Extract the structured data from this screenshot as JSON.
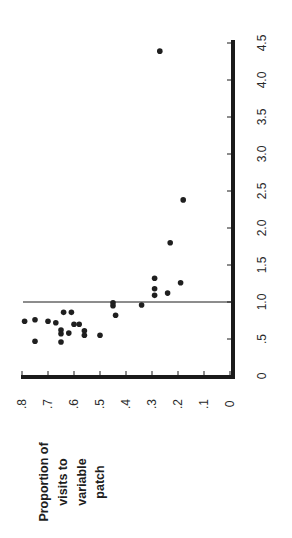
{
  "chart_data": {
    "type": "scatter",
    "orientation": "rotated 90 degrees counter-clockwise",
    "title": "",
    "ylabel": "Proportion of visits to variable patch",
    "ylabel_lines": [
      "Proportion of",
      "visits to",
      "variable",
      "patch"
    ],
    "xlabel": "",
    "proportion_axis": {
      "ticks": [
        ".8",
        ".7",
        ".6",
        ".5",
        ".4",
        ".3",
        ".2",
        ".1",
        "0"
      ],
      "tick_values": [
        0.8,
        0.7,
        0.6,
        0.5,
        0.4,
        0.3,
        0.2,
        0.1,
        0.0
      ],
      "range": [
        0,
        0.8
      ]
    },
    "ratio_axis": {
      "ticks": [
        "0",
        ".5",
        "1.0",
        "1.5",
        "2.0",
        "2.5",
        "3.0",
        "3.5",
        "4.0",
        "4.5"
      ],
      "tick_values": [
        0,
        0.5,
        1.0,
        1.5,
        2.0,
        2.5,
        3.0,
        3.5,
        4.0,
        4.5
      ],
      "range": [
        0,
        4.5
      ]
    },
    "reference_line": {
      "ratio": 1.0
    },
    "grid": false,
    "legend": null,
    "points": [
      {
        "proportion": 0.79,
        "ratio": 0.74
      },
      {
        "proportion": 0.75,
        "ratio": 0.76
      },
      {
        "proportion": 0.75,
        "ratio": 0.47
      },
      {
        "proportion": 0.7,
        "ratio": 0.74
      },
      {
        "proportion": 0.67,
        "ratio": 0.72
      },
      {
        "proportion": 0.64,
        "ratio": 0.86
      },
      {
        "proportion": 0.61,
        "ratio": 0.86
      },
      {
        "proportion": 0.65,
        "ratio": 0.62
      },
      {
        "proportion": 0.65,
        "ratio": 0.57
      },
      {
        "proportion": 0.65,
        "ratio": 0.46
      },
      {
        "proportion": 0.62,
        "ratio": 0.58
      },
      {
        "proportion": 0.6,
        "ratio": 0.7
      },
      {
        "proportion": 0.58,
        "ratio": 0.7
      },
      {
        "proportion": 0.56,
        "ratio": 0.61
      },
      {
        "proportion": 0.56,
        "ratio": 0.55
      },
      {
        "proportion": 0.5,
        "ratio": 0.55
      },
      {
        "proportion": 0.45,
        "ratio": 0.99
      },
      {
        "proportion": 0.45,
        "ratio": 0.95
      },
      {
        "proportion": 0.44,
        "ratio": 0.82
      },
      {
        "proportion": 0.34,
        "ratio": 0.96
      },
      {
        "proportion": 0.29,
        "ratio": 1.32
      },
      {
        "proportion": 0.29,
        "ratio": 1.18
      },
      {
        "proportion": 0.29,
        "ratio": 1.09
      },
      {
        "proportion": 0.24,
        "ratio": 1.12
      },
      {
        "proportion": 0.23,
        "ratio": 1.8
      },
      {
        "proportion": 0.19,
        "ratio": 1.26
      },
      {
        "proportion": 0.18,
        "ratio": 2.38
      },
      {
        "proportion": 0.27,
        "ratio": 4.39
      }
    ]
  },
  "colors": {
    "background": "#ffffff",
    "axis": "#1a1a1a",
    "points": "#1f1f1f",
    "text": "#2a2a2a"
  }
}
